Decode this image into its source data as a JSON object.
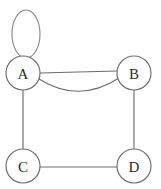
{
  "figure": {
    "background_color": "#ffffff",
    "edge_color": "#6e6e6e",
    "node_fill": "#ffffff",
    "label_color": "#2b2b2b",
    "width": 161,
    "height": 189
  },
  "nodes": [
    {
      "id": "A",
      "label": "A",
      "cx": 23,
      "cy": 73,
      "r": 17
    },
    {
      "id": "B",
      "label": "B",
      "cx": 134,
      "cy": 73,
      "r": 17
    },
    {
      "id": "C",
      "label": "C",
      "cx": 23,
      "cy": 166,
      "r": 17
    },
    {
      "id": "D",
      "label": "D",
      "cx": 134,
      "cy": 166,
      "r": 17
    }
  ],
  "edges": [
    {
      "id": "loop-a",
      "from": "A",
      "to": "A",
      "kind": "self-loop",
      "shape": "vertical-ellipse",
      "cx": 26,
      "cy": 34,
      "rx": 14,
      "ry": 24
    },
    {
      "id": "a-b-straight",
      "from": "A",
      "to": "B",
      "kind": "straight",
      "x1": 40,
      "y1": 73,
      "x2": 117,
      "y2": 71
    },
    {
      "id": "a-b-curved",
      "from": "A",
      "to": "B",
      "kind": "curved",
      "x1": 39,
      "y1": 78,
      "cx": 78,
      "cy": 103,
      "x2": 119,
      "y2": 78
    },
    {
      "id": "a-c",
      "from": "A",
      "to": "C",
      "kind": "straight",
      "x1": 23,
      "y1": 90,
      "x2": 23,
      "y2": 149
    },
    {
      "id": "b-d",
      "from": "B",
      "to": "D",
      "kind": "straight",
      "x1": 134,
      "y1": 90,
      "x2": 134,
      "y2": 149
    },
    {
      "id": "c-d",
      "from": "C",
      "to": "D",
      "kind": "straight",
      "x1": 40,
      "y1": 167,
      "x2": 117,
      "y2": 167
    }
  ]
}
